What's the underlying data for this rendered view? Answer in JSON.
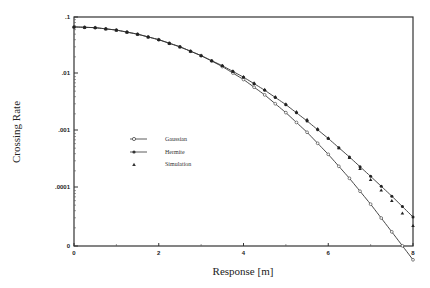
{
  "chart_data": {
    "type": "line",
    "title": "",
    "xlabel": "Response [m]",
    "ylabel": "Crossing Rate",
    "xlim": [
      0,
      8
    ],
    "ylim": [
      1e-05,
      0.1
    ],
    "yscale": "log",
    "x_ticks": [
      "0",
      "2",
      "4",
      "6",
      "8"
    ],
    "y_ticks": [
      ".1",
      ".01",
      ".001",
      ".0001",
      "0"
    ],
    "grid": false,
    "legend_position": "left-center",
    "x": [
      0,
      0.5,
      1,
      1.5,
      2,
      2.5,
      3,
      3.5,
      4,
      4.5,
      5,
      5.5,
      6,
      6.5,
      7,
      7.5,
      8
    ],
    "series": [
      {
        "name": "Gaussian",
        "marker": "open-circle",
        "values": [
          0.067,
          0.065,
          0.059,
          0.05,
          0.04,
          0.03,
          0.021,
          0.0135,
          0.008,
          0.0043,
          0.0021,
          0.00095,
          0.00039,
          0.000148,
          5.2e-05,
          1.7e-05,
          5.5e-06
        ]
      },
      {
        "name": "Hermite",
        "marker": "filled-circle",
        "values": [
          0.067,
          0.065,
          0.059,
          0.05,
          0.04,
          0.03,
          0.021,
          0.014,
          0.0088,
          0.0052,
          0.0029,
          0.0015,
          0.00074,
          0.00035,
          0.00016,
          7.2e-05,
          3.1e-05
        ]
      },
      {
        "name": "Simulation",
        "marker": "filled-triangle",
        "values": [
          0.067,
          0.065,
          0.059,
          0.05,
          0.04,
          0.03,
          0.021,
          0.0142,
          0.009,
          0.0054,
          0.003,
          0.0016,
          0.00076,
          0.00034,
          0.00014,
          6e-05,
          2.2e-05
        ]
      }
    ]
  },
  "axes": {
    "xlabel": "Response [m]",
    "ylabel": "Crossing Rate"
  },
  "legend": {
    "items": [
      {
        "label": "Gaussian"
      },
      {
        "label": "Hermite"
      },
      {
        "label": "Simulation"
      }
    ]
  }
}
